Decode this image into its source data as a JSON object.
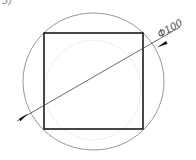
{
  "figure": {
    "partial_label": "3)",
    "dimension_label": "Φ100",
    "colors": {
      "background": "#ffffff",
      "circle": "#8a8a8a",
      "square": "#1a1a1a",
      "dimension_line": "#444444",
      "ghost_circle": "#ececec"
    },
    "circle": {
      "cx": 93.5,
      "cy": 81.5,
      "rx": 70.5,
      "ry": 68.5
    },
    "square": {
      "x": 44,
      "y": 33,
      "width": 99,
      "height": 96
    },
    "dimension_line": {
      "x1": 17,
      "y1": 121,
      "x2": 180,
      "y2": 27
    }
  }
}
